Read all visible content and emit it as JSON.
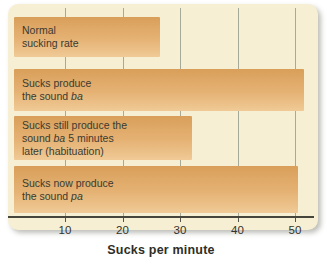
{
  "chart_data": {
    "type": "bar",
    "orientation": "horizontal",
    "title": "",
    "xlabel": "Sucks per minute",
    "ylabel": "",
    "xlim": [
      0,
      55
    ],
    "xticks": [
      10,
      20,
      30,
      40,
      50
    ],
    "grid": true,
    "legend": false,
    "categories": [
      "Normal sucking rate",
      "Sucks produce the sound ba",
      "Sucks still produce the sound ba 5 minutes later (habituation)",
      "Sucks now produce the sound pa"
    ],
    "values": [
      26.5,
      51.5,
      32,
      50.5
    ],
    "bar_label_lines": [
      [
        "Normal",
        "sucking rate"
      ],
      [
        "Sucks produce",
        "the sound *ba*"
      ],
      [
        "Sucks still produce the",
        "sound *ba* 5 minutes",
        "later (habituation)"
      ],
      [
        "Sucks now produce",
        "the sound *pa*"
      ]
    ]
  },
  "colors": {
    "page_bg": "#ffffff",
    "card_bg": "#f6efd3",
    "bar_gradient_top": "#d99f5a",
    "bar_gradient_bottom": "#f0ca96",
    "gridline": "#a6ab99",
    "axis_line": "#45453c",
    "label_text": "#3a3a30"
  }
}
